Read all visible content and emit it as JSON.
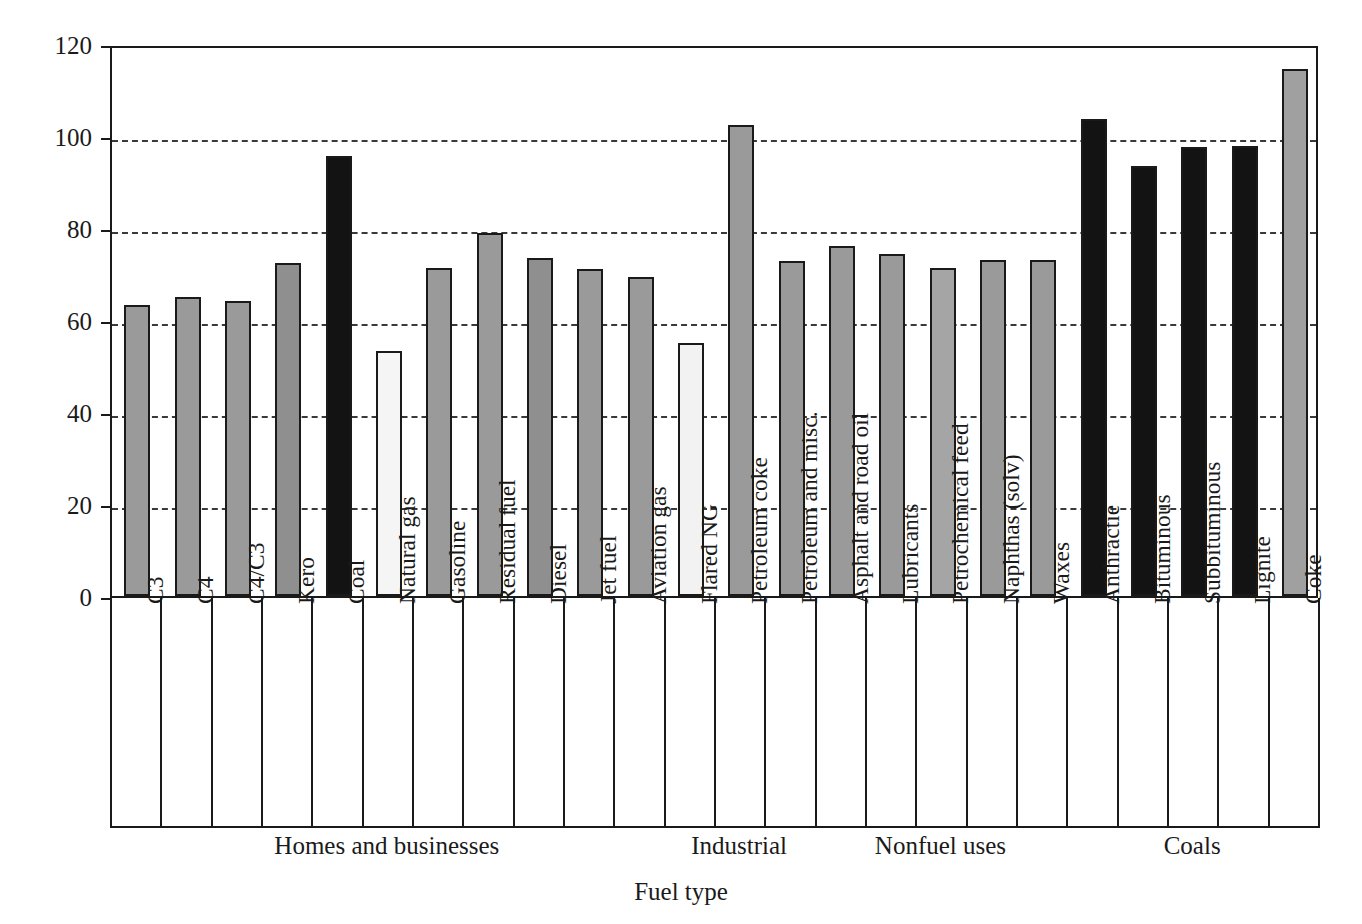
{
  "chart_data": {
    "type": "bar",
    "title": "",
    "xlabel": "Fuel type",
    "ylabel": "kg CO2/MBUT",
    "ylabel_html": "kg CO<sub>2</sub>/MBUT",
    "ylim": [
      0,
      120
    ],
    "yticks": [
      0,
      20,
      40,
      60,
      80,
      100,
      120
    ],
    "grid": "horizontal-dashed",
    "legend": "none",
    "categories": [
      "C3",
      "C4",
      "C4/C3",
      "Kero",
      "Coal",
      "Natural gas",
      "Gasoline",
      "Residual fuel",
      "Diesel",
      "Jet fuel",
      "Aviation gas",
      "Flared NG",
      "Petroleum coke",
      "Petroleum and misc.",
      "Asphalt and road oil",
      "Lubricants",
      "Petrochemical feed",
      "Naphthas (solv)",
      "Waxes",
      "Anthractie",
      "Bituminous",
      "Subbituminous",
      "Lignite",
      "Coke"
    ],
    "values": [
      63.2,
      65.1,
      64.1,
      72.3,
      95.6,
      53.3,
      71.4,
      78.9,
      73.5,
      71.0,
      69.4,
      55.0,
      102.4,
      72.9,
      76.0,
      74.4,
      71.3,
      73.0,
      73.0,
      103.8,
      93.5,
      97.6,
      97.9,
      114.5
    ],
    "bar_fills": [
      "#9a9a9a",
      "#9a9a9a",
      "#9a9a9a",
      "#8f8f8f",
      "#131313",
      "#f5f5f5",
      "#9a9a9a",
      "#9a9a9a",
      "#8f8f8f",
      "#9a9a9a",
      "#9a9a9a",
      "#f2f2f2",
      "#9a9a9a",
      "#9a9a9a",
      "#9a9a9a",
      "#9a9a9a",
      "#a5a5a5",
      "#9a9a9a",
      "#9a9a9a",
      "#131313",
      "#131313",
      "#131313",
      "#131313",
      "#a0a0a0"
    ],
    "groups": [
      {
        "label": "Homes and businesses",
        "start": 0,
        "end": 10
      },
      {
        "label": "Industrial",
        "start": 11,
        "end": 13
      },
      {
        "label": "Nonfuel uses",
        "start": 14,
        "end": 18
      },
      {
        "label": "Coals",
        "start": 19,
        "end": 23
      }
    ],
    "colors": {
      "axis": "#1a1a1a",
      "grid": "#3a3a3a",
      "bar_gray": "#9a9a9a",
      "bar_black": "#131313",
      "bar_white": "#f5f5f5",
      "background": "#ffffff"
    }
  }
}
